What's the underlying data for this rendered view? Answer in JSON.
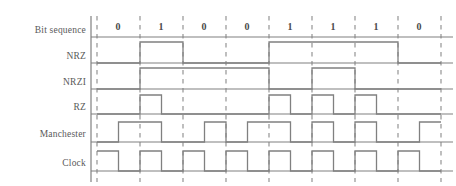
{
  "figure": {
    "background_color": "#ffffff",
    "line_color": "#808080",
    "dash_color": "#8a8a8a",
    "text_color": "#4d4d4d"
  },
  "axis": {
    "left_rail_x": 91,
    "plot_start_x": 97,
    "plot_end_x": 441,
    "bit_width": 43,
    "bit_count": 8,
    "boundaries": [
      97,
      140,
      183,
      226,
      269,
      312,
      355,
      398,
      441
    ]
  },
  "bit_sequence": {
    "label": "Bit sequence",
    "bits": [
      "0",
      "1",
      "0",
      "0",
      "1",
      "1",
      "1",
      "0"
    ]
  },
  "rows": [
    {
      "name": "nrz",
      "label": "NRZ",
      "baseline_y": 63,
      "high_y": 42,
      "levels": [
        0,
        1,
        0,
        0,
        1,
        1,
        1,
        0
      ]
    },
    {
      "name": "nrzi",
      "label": "NRZI",
      "baseline_y": 89,
      "high_y": 68,
      "levels": [
        0,
        1,
        1,
        1,
        0,
        1,
        0,
        0
      ]
    },
    {
      "name": "rz",
      "label": "RZ",
      "baseline_y": 114,
      "high_y": 95,
      "half_levels": [
        [
          0,
          0
        ],
        [
          1,
          0
        ],
        [
          0,
          0
        ],
        [
          0,
          0
        ],
        [
          1,
          0
        ],
        [
          1,
          0
        ],
        [
          1,
          0
        ],
        [
          0,
          0
        ]
      ]
    },
    {
      "name": "manchester",
      "label": "Manchester",
      "baseline_y": 142,
      "high_y": 122,
      "half_levels": [
        [
          0,
          1
        ],
        [
          1,
          0
        ],
        [
          0,
          1
        ],
        [
          0,
          1
        ],
        [
          1,
          0
        ],
        [
          1,
          0
        ],
        [
          1,
          0
        ],
        [
          0,
          1
        ]
      ]
    },
    {
      "name": "clock",
      "label": "Clock",
      "baseline_y": 171,
      "high_y": 151,
      "half_levels": [
        [
          1,
          0
        ],
        [
          1,
          0
        ],
        [
          1,
          0
        ],
        [
          1,
          0
        ],
        [
          1,
          0
        ],
        [
          1,
          0
        ],
        [
          1,
          0
        ],
        [
          1,
          0
        ]
      ]
    }
  ],
  "chart_data": {
    "type": "line",
    "xlabel": "Bit time",
    "ylabel": "Signal level",
    "categories": [
      "0",
      "1",
      "0",
      "0",
      "1",
      "1",
      "1",
      "0"
    ],
    "series": [
      {
        "name": "Bit sequence",
        "values": [
          0,
          1,
          0,
          0,
          1,
          1,
          1,
          0
        ]
      },
      {
        "name": "NRZ",
        "values": [
          0,
          1,
          0,
          0,
          1,
          1,
          1,
          0
        ]
      },
      {
        "name": "NRZI",
        "values": [
          0,
          1,
          1,
          1,
          0,
          1,
          0,
          0
        ]
      },
      {
        "name": "RZ",
        "half_bit_values": [
          0,
          0,
          1,
          0,
          0,
          0,
          0,
          0,
          1,
          0,
          1,
          0,
          1,
          0,
          0,
          0
        ]
      },
      {
        "name": "Manchester",
        "half_bit_values": [
          0,
          1,
          1,
          0,
          0,
          1,
          0,
          1,
          1,
          0,
          1,
          0,
          1,
          0,
          0,
          1
        ]
      },
      {
        "name": "Clock",
        "half_bit_values": [
          1,
          0,
          1,
          0,
          1,
          0,
          1,
          0,
          1,
          0,
          1,
          0,
          1,
          0,
          1,
          0
        ]
      }
    ],
    "ylim": [
      0,
      1
    ],
    "grid": true,
    "legend": "left-row-labels"
  }
}
